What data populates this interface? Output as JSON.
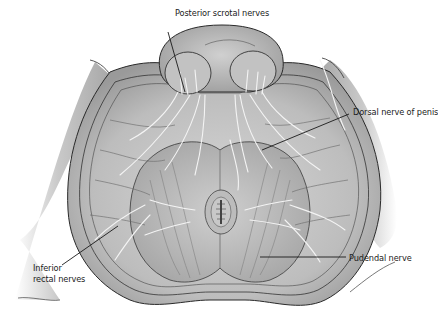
{
  "figure": {
    "style": "grayscale pencil drawing",
    "colors": {
      "background": "#ffffff",
      "skin_light": "#dcdcdc",
      "skin_mid": "#b9b9b9",
      "skin_dark": "#8f8f8f",
      "outline": "#2a2a2a",
      "nerve": "#f2f2f2",
      "leader_line": "#1a1a1a"
    }
  },
  "labels": [
    {
      "id": "posterior-scrotal-nerves",
      "text": "Posterior scrotal nerves"
    },
    {
      "id": "dorsal-nerve-of-penis",
      "text": "Dorsal nerve of penis"
    },
    {
      "id": "inferior-rectal-nerves",
      "line1": "Inferior",
      "line2": "rectal nerves"
    },
    {
      "id": "pudendal-nerve",
      "text": "Pudendal nerve"
    }
  ]
}
